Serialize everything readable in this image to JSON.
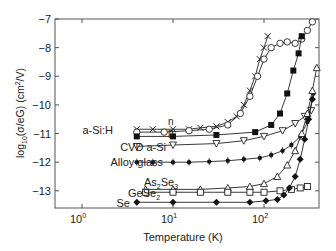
{
  "chart_data": {
    "type": "scatter",
    "title": "",
    "xlabel": "Temperature (K)",
    "ylabel": "log10(σ/eG) (cm²/V)",
    "xscale": "log",
    "xlim": [
      0.5,
      400
    ],
    "ylim": [
      -13.6,
      -7
    ],
    "x_ticks": [
      {
        "value": 1,
        "label": "10",
        "exp": "0"
      },
      {
        "value": 10,
        "label": "10",
        "exp": "1"
      },
      {
        "value": 100,
        "label": "10",
        "exp": "2"
      }
    ],
    "y_ticks": [
      -7,
      -8,
      -9,
      -10,
      -11,
      -12,
      -13
    ],
    "grid": false,
    "legend": "inline labels",
    "series": [
      {
        "name": "a-Si:H n (crosses)",
        "marker": "x",
        "points": [
          [
            4,
            -10.85
          ],
          [
            6,
            -10.85
          ],
          [
            10,
            -10.85
          ],
          [
            15,
            -10.85
          ],
          [
            20,
            -10.8
          ],
          [
            30,
            -10.75
          ],
          [
            40,
            -10.6
          ],
          [
            50,
            -10.4
          ],
          [
            60,
            -10.0
          ],
          [
            70,
            -9.5
          ],
          [
            80,
            -9.0
          ],
          [
            90,
            -8.4
          ],
          [
            100,
            -8.0
          ],
          [
            110,
            -7.6
          ]
        ]
      },
      {
        "name": "a-Si:H n (circles)",
        "marker": "o",
        "points": [
          [
            4,
            -10.95
          ],
          [
            8,
            -10.95
          ],
          [
            15,
            -10.9
          ],
          [
            25,
            -10.85
          ],
          [
            40,
            -10.7
          ],
          [
            55,
            -10.3
          ],
          [
            70,
            -9.7
          ],
          [
            85,
            -9.0
          ],
          [
            100,
            -8.4
          ],
          [
            120,
            -8.0
          ],
          [
            150,
            -7.85
          ],
          [
            180,
            -7.8
          ],
          [
            220,
            -7.85
          ],
          [
            260,
            -7.7
          ],
          [
            300,
            -7.4
          ],
          [
            340,
            -7.1
          ]
        ]
      },
      {
        "name": "a-Si:H p",
        "marker": "filled-square",
        "points": [
          [
            4,
            -11.1
          ],
          [
            10,
            -11.1
          ],
          [
            30,
            -11.05
          ],
          [
            80,
            -10.95
          ],
          [
            120,
            -10.7
          ],
          [
            150,
            -10.3
          ],
          [
            180,
            -9.6
          ],
          [
            210,
            -8.8
          ],
          [
            240,
            -8.2
          ],
          [
            260,
            -7.6
          ]
        ]
      },
      {
        "name": "CVD a-Si",
        "marker": "down-triangle",
        "points": [
          [
            4,
            -11.45
          ],
          [
            10,
            -11.4
          ],
          [
            30,
            -11.35
          ],
          [
            60,
            -11.25
          ],
          [
            100,
            -11.1
          ],
          [
            160,
            -10.9
          ],
          [
            220,
            -10.65
          ],
          [
            280,
            -10.4
          ],
          [
            330,
            -10.2
          ]
        ]
      },
      {
        "name": "Alloy glass",
        "marker": "filled-circle-plus",
        "points": [
          [
            4,
            -12.0
          ],
          [
            6,
            -12.0
          ],
          [
            10,
            -12.0
          ],
          [
            15,
            -12.0
          ],
          [
            25,
            -11.98
          ],
          [
            40,
            -11.95
          ],
          [
            60,
            -11.9
          ],
          [
            90,
            -11.85
          ],
          [
            120,
            -11.75
          ],
          [
            160,
            -11.6
          ],
          [
            200,
            -11.4
          ],
          [
            250,
            -11.1
          ],
          [
            300,
            -10.6
          ],
          [
            350,
            -9.6
          ]
        ]
      },
      {
        "name": "As2Se3",
        "marker": "up-triangle",
        "points": [
          [
            5,
            -12.95
          ],
          [
            10,
            -12.95
          ],
          [
            20,
            -12.95
          ],
          [
            40,
            -12.9
          ],
          [
            70,
            -12.85
          ],
          [
            100,
            -12.75
          ],
          [
            140,
            -12.5
          ],
          [
            180,
            -12.1
          ],
          [
            220,
            -11.6
          ],
          [
            260,
            -11.0
          ],
          [
            300,
            -10.3
          ],
          [
            340,
            -9.5
          ],
          [
            380,
            -8.7
          ]
        ]
      },
      {
        "name": "GeSe2",
        "marker": "open-square",
        "points": [
          [
            5,
            -13.05
          ],
          [
            10,
            -13.05
          ],
          [
            20,
            -13.05
          ],
          [
            40,
            -13.05
          ],
          [
            70,
            -13.05
          ],
          [
            100,
            -13.05
          ],
          [
            150,
            -13.0
          ],
          [
            200,
            -12.95
          ],
          [
            250,
            -12.9
          ],
          [
            300,
            -12.85
          ]
        ]
      },
      {
        "name": "Se",
        "marker": "filled-diamond",
        "points": [
          [
            4,
            -13.4
          ],
          [
            10,
            -13.4
          ],
          [
            30,
            -13.4
          ],
          [
            70,
            -13.4
          ],
          [
            105,
            -13.35
          ],
          [
            140,
            -13.3
          ],
          [
            165,
            -13.15
          ],
          [
            190,
            -12.9
          ],
          [
            220,
            -12.5
          ],
          [
            250,
            -11.9
          ],
          [
            280,
            -11.2
          ],
          [
            310,
            -10.5
          ],
          [
            340,
            -9.8
          ]
        ]
      }
    ],
    "annotations": [
      {
        "text": "n",
        "T": 2.6,
        "y": -10.45
      },
      {
        "text": "a-Si:H",
        "T": 2.3,
        "y": -10.95
      },
      {
        "text": "p",
        "T": 2.6,
        "y": -11.15
      },
      {
        "text": "CVD a-Si",
        "T": 2.2,
        "y": -11.45
      },
      {
        "text": "Alloy glass",
        "T": 2.9,
        "y": -12.0
      },
      {
        "text": "As2Se3",
        "T": 2.4,
        "y": -12.6
      },
      {
        "text": "GeSe2",
        "T": 2.4,
        "y": -13.05
      },
      {
        "text": "Se",
        "T": 2.6,
        "y": -13.4
      }
    ]
  },
  "labels": {
    "xlabel": "Temperature (K)",
    "ylabel_prefix": "log",
    "ylabel_sub": "10",
    "ylabel_mid": "(σ/eG) (cm",
    "ylabel_sup": "2",
    "ylabel_end": "/V)",
    "series_labels": {
      "n": "n",
      "asih": "a-Si:H",
      "p": "p",
      "cvd": "CVD a-Si",
      "alloy": "Alloy glass",
      "as2se3_a": "As",
      "as2se3_b": "2",
      "as2se3_c": "Se",
      "as2se3_d": "3",
      "gese2_a": "GeSe",
      "gese2_b": "2",
      "se": "Se"
    }
  }
}
